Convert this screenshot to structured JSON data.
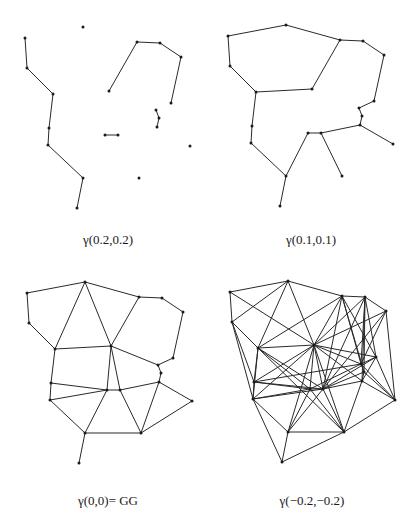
{
  "figure": {
    "points": [
      "A",
      "B",
      "C",
      "D",
      "E",
      "F",
      "G",
      "H",
      "I",
      "J",
      "K",
      "L",
      "M",
      "N",
      "O",
      "P",
      "Q",
      "R",
      "S",
      "T"
    ],
    "base_coords": {
      "A": [
        27,
        33
      ],
      "B": [
        85,
        22
      ],
      "C": [
        29,
        63
      ],
      "D": [
        55,
        89
      ],
      "E": [
        139,
        37
      ],
      "F": [
        162,
        38
      ],
      "G": [
        183,
        52
      ],
      "H": [
        111,
        86
      ],
      "I": [
        173,
        98
      ],
      "J": [
        158,
        105
      ],
      "K": [
        161,
        113
      ],
      "L": [
        159,
        122
      ],
      "M": [
        51,
        123
      ],
      "N": [
        107,
        130
      ],
      "O": [
        120,
        130
      ],
      "P": [
        50,
        140
      ],
      "Q": [
        192,
        141
      ],
      "R": [
        85,
        173
      ],
      "S": [
        141,
        173
      ],
      "T": [
        79,
        203
      ]
    },
    "panels": [
      {
        "id": "p1",
        "caption": "γ(0.2,0.2)",
        "offset": [
          -2,
          5
        ],
        "caption_pos": [
          38,
          232
        ],
        "edges": [
          [
            "A",
            "C"
          ],
          [
            "C",
            "D"
          ],
          [
            "D",
            "M"
          ],
          [
            "M",
            "P"
          ],
          [
            "P",
            "R"
          ],
          [
            "R",
            "T"
          ],
          [
            "H",
            "E"
          ],
          [
            "E",
            "F"
          ],
          [
            "F",
            "G"
          ],
          [
            "G",
            "I"
          ],
          [
            "J",
            "K"
          ],
          [
            "K",
            "L"
          ],
          [
            "N",
            "O"
          ]
        ]
      },
      {
        "id": "p2",
        "caption": "γ(0.1,0.1)",
        "offset": [
          201,
          3
        ],
        "caption_pos": [
          241,
          232
        ],
        "edges": [
          [
            "A",
            "B"
          ],
          [
            "B",
            "E"
          ],
          [
            "A",
            "C"
          ],
          [
            "C",
            "D"
          ],
          [
            "D",
            "H"
          ],
          [
            "H",
            "E"
          ],
          [
            "E",
            "F"
          ],
          [
            "F",
            "G"
          ],
          [
            "G",
            "I"
          ],
          [
            "I",
            "J"
          ],
          [
            "J",
            "K"
          ],
          [
            "K",
            "L"
          ],
          [
            "D",
            "M"
          ],
          [
            "M",
            "P"
          ],
          [
            "P",
            "R"
          ],
          [
            "R",
            "T"
          ],
          [
            "R",
            "N"
          ],
          [
            "N",
            "O"
          ],
          [
            "O",
            "L"
          ],
          [
            "L",
            "Q"
          ],
          [
            "O",
            "S"
          ]
        ]
      },
      {
        "id": "p3",
        "caption": "γ(0,0)= GG",
        "offset": [
          0,
          260
        ],
        "caption_pos": [
          38,
          493
        ],
        "edges": [
          [
            "A",
            "B"
          ],
          [
            "A",
            "C"
          ],
          [
            "C",
            "D"
          ],
          [
            "B",
            "D"
          ],
          [
            "B",
            "H"
          ],
          [
            "B",
            "E"
          ],
          [
            "E",
            "F"
          ],
          [
            "F",
            "G"
          ],
          [
            "G",
            "I"
          ],
          [
            "I",
            "J"
          ],
          [
            "J",
            "K"
          ],
          [
            "K",
            "L"
          ],
          [
            "E",
            "H"
          ],
          [
            "D",
            "H"
          ],
          [
            "H",
            "J"
          ],
          [
            "D",
            "M"
          ],
          [
            "M",
            "N"
          ],
          [
            "M",
            "P"
          ],
          [
            "P",
            "N"
          ],
          [
            "H",
            "N"
          ],
          [
            "H",
            "O"
          ],
          [
            "N",
            "O"
          ],
          [
            "O",
            "L"
          ],
          [
            "L",
            "Q"
          ],
          [
            "N",
            "R"
          ],
          [
            "P",
            "R"
          ],
          [
            "R",
            "S"
          ],
          [
            "O",
            "S"
          ],
          [
            "L",
            "S"
          ],
          [
            "Q",
            "S"
          ],
          [
            "R",
            "T"
          ]
        ]
      },
      {
        "id": "p4",
        "caption": "γ(−0.2,−0.2)",
        "offset": [
          203,
          259
        ],
        "caption_pos": [
          242,
          493
        ],
        "edges": [
          [
            "A",
            "B"
          ],
          [
            "A",
            "C"
          ],
          [
            "A",
            "H"
          ],
          [
            "B",
            "C"
          ],
          [
            "B",
            "D"
          ],
          [
            "B",
            "H"
          ],
          [
            "B",
            "E"
          ],
          [
            "E",
            "F"
          ],
          [
            "F",
            "G"
          ],
          [
            "C",
            "D"
          ],
          [
            "C",
            "M"
          ],
          [
            "C",
            "P"
          ],
          [
            "D",
            "H"
          ],
          [
            "D",
            "E"
          ],
          [
            "D",
            "O"
          ],
          [
            "D",
            "M"
          ],
          [
            "D",
            "N"
          ],
          [
            "D",
            "P"
          ],
          [
            "D",
            "S"
          ],
          [
            "H",
            "E"
          ],
          [
            "H",
            "F"
          ],
          [
            "H",
            "G"
          ],
          [
            "H",
            "I"
          ],
          [
            "H",
            "J"
          ],
          [
            "H",
            "L"
          ],
          [
            "H",
            "N"
          ],
          [
            "H",
            "O"
          ],
          [
            "H",
            "M"
          ],
          [
            "H",
            "P"
          ],
          [
            "H",
            "S"
          ],
          [
            "H",
            "R"
          ],
          [
            "E",
            "J"
          ],
          [
            "E",
            "I"
          ],
          [
            "E",
            "K"
          ],
          [
            "E",
            "O"
          ],
          [
            "F",
            "I"
          ],
          [
            "F",
            "J"
          ],
          [
            "F",
            "L"
          ],
          [
            "F",
            "O"
          ],
          [
            "F",
            "K"
          ],
          [
            "G",
            "J"
          ],
          [
            "G",
            "Q"
          ],
          [
            "G",
            "O"
          ],
          [
            "I",
            "J"
          ],
          [
            "I",
            "L"
          ],
          [
            "I",
            "O"
          ],
          [
            "I",
            "Q"
          ],
          [
            "J",
            "K"
          ],
          [
            "J",
            "N"
          ],
          [
            "J",
            "Q"
          ],
          [
            "K",
            "L"
          ],
          [
            "K",
            "Q"
          ],
          [
            "K",
            "O"
          ],
          [
            "L",
            "Q"
          ],
          [
            "L",
            "S"
          ],
          [
            "M",
            "N"
          ],
          [
            "M",
            "P"
          ],
          [
            "M",
            "O"
          ],
          [
            "M",
            "J"
          ],
          [
            "N",
            "O"
          ],
          [
            "N",
            "R"
          ],
          [
            "N",
            "S"
          ],
          [
            "N",
            "P"
          ],
          [
            "O",
            "S"
          ],
          [
            "O",
            "R"
          ],
          [
            "O",
            "L"
          ],
          [
            "P",
            "R"
          ],
          [
            "P",
            "T"
          ],
          [
            "P",
            "O"
          ],
          [
            "R",
            "S"
          ],
          [
            "R",
            "T"
          ],
          [
            "S",
            "Q"
          ],
          [
            "S",
            "T"
          ]
        ]
      }
    ]
  }
}
